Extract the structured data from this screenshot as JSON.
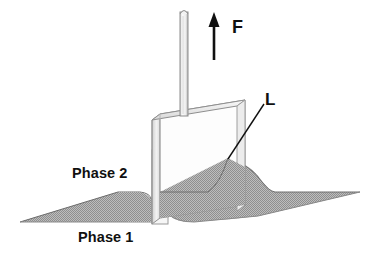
{
  "figure": {
    "background_color": "#ffffff",
    "width": 371,
    "height": 258
  },
  "labels": {
    "phase_lower": "Phase 1",
    "phase_upper": "Phase 2",
    "force": "F",
    "contact_line": "L"
  },
  "colors": {
    "fluid_fill": "#a9a9a9",
    "outline": "#1a1a1a",
    "plate_face": "#fdfdfd",
    "plate_edge_shade": "#e9e9e9",
    "rod_fill": "#f4f4f4",
    "leader_line": "#1a1a1a"
  },
  "elements": {
    "rod_name": "suspension rod",
    "arrow_name": "upward force arrow",
    "plate_name": "vertical plate",
    "meniscus_name": "curved meniscus at plate",
    "interface_name": "horizontal fluid interface plane",
    "leader_name": "leader line to contact line"
  },
  "geometry": {
    "rod_top_y": 8,
    "rod_bottom_y": 118,
    "rod_x": 180,
    "rod_width": 8,
    "arrow_x": 214,
    "arrow_tail_y": 60,
    "arrow_tip_y": 16,
    "plate_top_left_x": 152,
    "plate_top_right_x": 245,
    "plate_bottom_y": 222,
    "interface_y": 192,
    "contact_point_x": 228,
    "contact_point_y": 158,
    "leader_end_x": 263,
    "leader_end_y": 103
  }
}
